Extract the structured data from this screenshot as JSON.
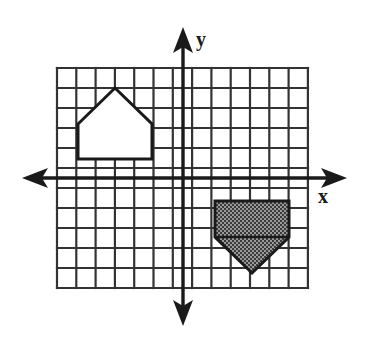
{
  "figure": {
    "background_color": "#ffffff",
    "ink_color": "#1a1a1a",
    "grid": {
      "columns": 13,
      "rows": 11,
      "left_px": 57,
      "top_px": 68,
      "cell_width_px": 19.3,
      "cell_height_px": 20,
      "line_color": "#333333",
      "line_width_px": 2.2,
      "visible": true
    },
    "axes": {
      "x_axis": {
        "label": "x",
        "y_px": 178,
        "start_px": 22,
        "end_px": 347,
        "arrows": "both",
        "line_width_px": 3.4
      },
      "y_axis": {
        "label": "y",
        "x_px": 183,
        "start_px": 27,
        "end_px": 326,
        "arrows": "both",
        "line_width_px": 3.4
      },
      "origin_px": {
        "x": 183,
        "y": 178
      }
    },
    "shapes": [
      {
        "name": "house-pentagon-unshaded",
        "kind": "pentagon",
        "fill": "none",
        "fill_label": "white / unshaded",
        "stroke": "#1a1a1a",
        "stroke_width_px": 3,
        "orientation": "apex-up",
        "grid_cells": {
          "x_from": -5.5,
          "x_to": -1.6,
          "y_from": 0.95,
          "y_to": 4.45
        },
        "points_px": "78,124 115,88 152,124 152,159 78,159"
      },
      {
        "name": "house-pentagon-shaded",
        "kind": "pentagon",
        "fill": "#6e6e6e",
        "fill_label": "shaded / stippled gray",
        "stroke": "#1a1a1a",
        "stroke_width_px": 3,
        "orientation": "apex-down",
        "grid_cells": {
          "x_from": 1.65,
          "x_to": 5.5,
          "y_from": -1.15,
          "y_to": -4.6
        },
        "points_px": "215,201 289,201 289,237 252,273 215,237"
      }
    ]
  },
  "chart_data": {
    "type": "scatter",
    "xlabel": "x",
    "ylabel": "y",
    "grid": true,
    "legend": "none",
    "xlim": [
      -6.5,
      6.5
    ],
    "ylim": [
      -5.5,
      5.5
    ],
    "x_tick_labels": [],
    "y_tick_labels": [],
    "annotations": [
      "Unshaded house-shaped pentagon in quadrant II (upper left)",
      "Shaded house-shaped pentagon, inverted, in quadrant IV (lower right)"
    ],
    "series": [
      {
        "name": "Unshaded pentagon (apex up)",
        "kind": "polygon",
        "fill": "none",
        "x": [
          -5.5,
          -3.5,
          -1.6,
          -1.6,
          -5.5
        ],
        "y": [
          2.7,
          4.5,
          2.7,
          0.95,
          0.95
        ]
      },
      {
        "name": "Shaded pentagon (apex down)",
        "kind": "polygon",
        "fill": "gray",
        "x": [
          1.65,
          5.5,
          5.5,
          3.6,
          1.65
        ],
        "y": [
          -1.15,
          -1.15,
          -2.95,
          -4.75,
          -2.95
        ]
      }
    ]
  }
}
